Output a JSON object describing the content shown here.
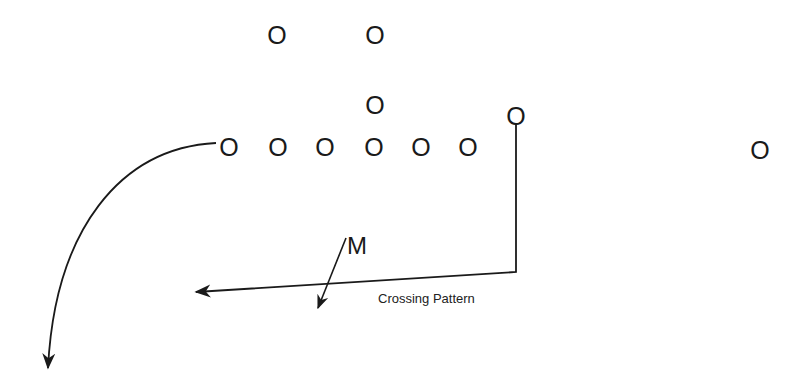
{
  "diagram": {
    "player_symbol": "O",
    "players": [
      {
        "id": "deep-left",
        "symbol": "O",
        "x": 277,
        "y": 35
      },
      {
        "id": "deep-middle",
        "symbol": "O",
        "x": 375,
        "y": 35
      },
      {
        "id": "back",
        "symbol": "O",
        "x": 375,
        "y": 105
      },
      {
        "id": "line-1",
        "symbol": "O",
        "x": 229,
        "y": 147
      },
      {
        "id": "line-2",
        "symbol": "O",
        "x": 278,
        "y": 147
      },
      {
        "id": "line-3",
        "symbol": "O",
        "x": 325,
        "y": 147
      },
      {
        "id": "line-4",
        "symbol": "O",
        "x": 374,
        "y": 147
      },
      {
        "id": "line-5",
        "symbol": "O",
        "x": 421,
        "y": 147
      },
      {
        "id": "line-6",
        "symbol": "O",
        "x": 468,
        "y": 147
      },
      {
        "id": "crossing-receiver",
        "symbol": "O",
        "x": 516,
        "y": 116
      },
      {
        "id": "wide-receiver",
        "symbol": "O",
        "x": 760,
        "y": 150
      }
    ],
    "marker_label": "M",
    "caption": "Crossing Pattern",
    "stroke_color": "#1a1a1a",
    "background": "#ffffff"
  }
}
